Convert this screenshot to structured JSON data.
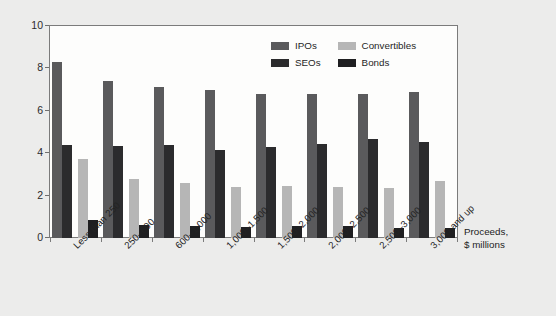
{
  "chart_data": {
    "type": "bar",
    "title": "",
    "subtitle": "",
    "xlabel": "Proceeds, $ millions",
    "ylabel": "Total direct costs, %",
    "ylim": [
      0,
      10
    ],
    "yticks": [
      0,
      2,
      4,
      6,
      8,
      10
    ],
    "ytick_labels": [
      "0",
      "2",
      "4",
      "6",
      "8",
      "10"
    ],
    "grid": false,
    "legend_position": "top-right-inside",
    "categories": [
      "Less than 250",
      "250–600",
      "600–1,000",
      "1,000–1,500",
      "1,500–2,000",
      "2,000–2,500",
      "2,500–3,000",
      "3,000 and up"
    ],
    "series": [
      {
        "name": "IPOs",
        "color": "#5a5a5c",
        "values": [
          8.3,
          7.4,
          7.1,
          7.0,
          6.8,
          6.8,
          6.8,
          6.9
        ]
      },
      {
        "name": "SEOs",
        "color": "#2b2b2d",
        "values": [
          4.4,
          4.35,
          4.4,
          4.15,
          4.3,
          4.45,
          4.65,
          4.55
        ]
      },
      {
        "name": "Convertibles",
        "color": "#b6b6b6",
        "values": [
          3.75,
          2.8,
          2.6,
          2.4,
          2.45,
          2.4,
          2.35,
          2.7
        ]
      },
      {
        "name": "Bonds",
        "color": "#1f1f21",
        "values": [
          0.85,
          0.6,
          0.55,
          0.5,
          0.55,
          0.55,
          0.45,
          0.45
        ]
      }
    ]
  },
  "legend": {
    "items": [
      {
        "label": "IPOs",
        "color": "#5a5a5c"
      },
      {
        "label": "Convertibles",
        "color": "#b6b6b6"
      },
      {
        "label": "SEOs",
        "color": "#2b2b2d"
      },
      {
        "label": "Bonds",
        "color": "#1f1f21"
      }
    ]
  },
  "axes": {
    "y_title": "Total direct costs, %",
    "x_title_line1": "Proceeds,",
    "x_title_line2": "$ millions"
  }
}
